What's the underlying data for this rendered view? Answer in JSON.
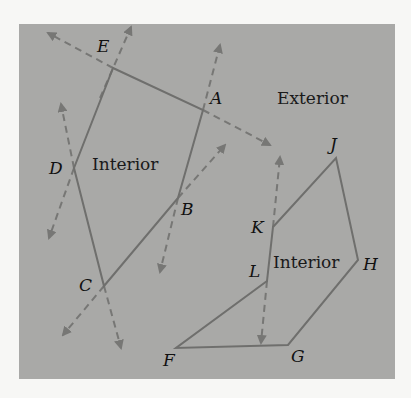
{
  "figure": {
    "background_color": "#a9a9a7",
    "page_color": "#f7f7f5",
    "edge_color": "#6f6f6d",
    "arrow_color": "#777775",
    "text_color": "#111111"
  },
  "regions": {
    "exterior_label": "Exterior",
    "interior_left_label": "Interior",
    "interior_right_label": "Interior"
  },
  "polygon_left": {
    "vertices": [
      {
        "name": "E",
        "x": 113,
        "y": 68
      },
      {
        "name": "A",
        "x": 203,
        "y": 110
      },
      {
        "name": "B",
        "x": 178,
        "y": 198
      },
      {
        "name": "C",
        "x": 104,
        "y": 286
      },
      {
        "name": "D",
        "x": 74,
        "y": 168
      }
    ],
    "labels": {
      "A": "A",
      "B": "B",
      "C": "C",
      "D": "D",
      "E": "E"
    }
  },
  "polygon_right": {
    "vertices": [
      {
        "name": "J",
        "x": 336,
        "y": 158
      },
      {
        "name": "H",
        "x": 358,
        "y": 260
      },
      {
        "name": "G",
        "x": 288,
        "y": 345
      },
      {
        "name": "F",
        "x": 176,
        "y": 348
      },
      {
        "name": "L",
        "x": 267,
        "y": 281
      },
      {
        "name": "K",
        "x": 273,
        "y": 227
      }
    ],
    "labels": {
      "F": "F",
      "G": "G",
      "H": "H",
      "J": "J",
      "K": "K",
      "L": "L"
    }
  },
  "extension_arrows": [
    {
      "from": "E",
      "direction": "up",
      "tip": [
        131,
        27
      ]
    },
    {
      "from": "E",
      "direction": "upper-left",
      "tip": [
        48,
        33
      ]
    },
    {
      "from": "D",
      "direction": "up",
      "tip": [
        61,
        104
      ]
    },
    {
      "from": "D",
      "direction": "down",
      "tip": [
        49,
        238
      ]
    },
    {
      "from": "A",
      "direction": "up",
      "tip": [
        220,
        45
      ]
    },
    {
      "from": "A",
      "direction": "lower-right",
      "tip": [
        270,
        145
      ]
    },
    {
      "from": "B",
      "direction": "upper-right",
      "tip": [
        225,
        145
      ]
    },
    {
      "from": "B",
      "direction": "down",
      "tip": [
        160,
        272
      ]
    },
    {
      "from": "C",
      "direction": "lower-left",
      "tip": [
        63,
        335
      ]
    },
    {
      "from": "C",
      "direction": "down",
      "tip": [
        121,
        348
      ]
    },
    {
      "from": "K",
      "direction": "up",
      "tip": [
        280,
        157
      ]
    },
    {
      "from": "L",
      "direction": "down",
      "tip": [
        261,
        343
      ]
    }
  ]
}
